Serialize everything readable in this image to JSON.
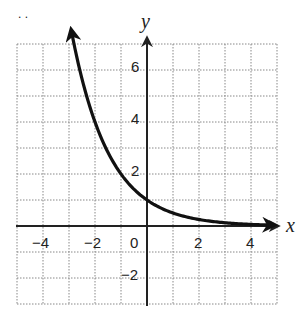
{
  "chart_data": {
    "type": "line",
    "title": "",
    "xlabel": "x",
    "ylabel": "y",
    "xlim": [
      -5,
      5
    ],
    "ylim": [
      -3,
      7
    ],
    "grid": true,
    "x_ticks": [
      -4,
      -2,
      0,
      2,
      4
    ],
    "y_ticks": [
      -2,
      2,
      4,
      6
    ],
    "tick_labels": {
      "x": [
        "−4",
        "−2",
        "0",
        "2",
        "4"
      ],
      "y": [
        "−2",
        "2",
        "4",
        "6"
      ]
    },
    "series": [
      {
        "name": "y = (1/2)^x",
        "function": "y = (1/2)^x",
        "x": [
          -2.9,
          -2.5,
          -2,
          -1.5,
          -1,
          -0.5,
          0,
          0.5,
          1,
          1.5,
          2,
          2.5,
          3,
          3.5,
          4,
          4.8
        ],
        "values": [
          7.46,
          5.66,
          4,
          2.83,
          2,
          1.41,
          1,
          0.71,
          0.5,
          0.35,
          0.25,
          0.18,
          0.125,
          0.09,
          0.06,
          0.04
        ],
        "arrows": [
          "start",
          "end"
        ]
      }
    ],
    "annotations": [
      ". ."
    ]
  },
  "labels": {
    "x_axis": "x",
    "y_axis": "y",
    "x_ticks": [
      "−4",
      "−2",
      "0",
      "2",
      "4"
    ],
    "y_ticks": [
      "6",
      "4",
      "2",
      "−2"
    ],
    "dots": ". ."
  }
}
